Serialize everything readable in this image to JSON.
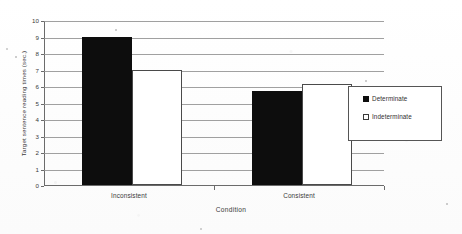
{
  "chart_data": {
    "type": "bar",
    "title": "",
    "xlabel": "Condition",
    "ylabel": "Target sentence reading times (sec.)",
    "categories": [
      "Inconsistent",
      "Consistent"
    ],
    "series": [
      {
        "name": "Determinate",
        "values": [
          9.0,
          5.7
        ],
        "color": "#0d0d0d",
        "fill": "solid"
      },
      {
        "name": "Indeterminate",
        "values": [
          7.0,
          6.1
        ],
        "color": "#ffffff",
        "fill": "hollow"
      }
    ],
    "ylim": [
      0,
      10
    ],
    "yticks": [
      0,
      1,
      2,
      3,
      4,
      5,
      6,
      7,
      8,
      9,
      10
    ],
    "ytick_labels": [
      "0",
      "1",
      "2",
      "3",
      "4",
      "5",
      "6",
      "7",
      "8",
      "9",
      "10"
    ],
    "grid": true,
    "grid_axis": "y",
    "legend_position": "right",
    "legend_entries": [
      "Determinate",
      "Indeterminate"
    ],
    "bar_edge_color": "#4a4a4a",
    "background_color": "#ffffff"
  },
  "axis": {
    "y_title": "Target sentence reading times (sec.)",
    "x_title": "Condition"
  },
  "legend": {
    "items": [
      {
        "label": "Determinate",
        "swatch": "filled-square-icon"
      },
      {
        "label": "Indeterminate",
        "swatch": "hollow-square-icon"
      }
    ]
  }
}
